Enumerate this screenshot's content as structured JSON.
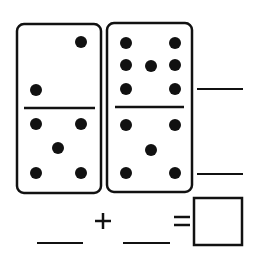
{
  "worksheet": {
    "colors": {
      "ink": "#111111",
      "paper": "#ffffff"
    },
    "dominoes": [
      {
        "top_pips": 2,
        "bottom_pips": 5,
        "top_dots": [
          [
            81,
            42
          ],
          [
            36,
            90
          ]
        ],
        "bottom_dots": [
          [
            36,
            124
          ],
          [
            81,
            124
          ],
          [
            58,
            148
          ],
          [
            36,
            173
          ],
          [
            81,
            173
          ]
        ]
      },
      {
        "top_pips": 7,
        "bottom_pips": 5,
        "top_dots": [
          [
            126,
            43
          ],
          [
            175,
            43
          ],
          [
            126,
            65
          ],
          [
            151,
            66
          ],
          [
            175,
            65
          ],
          [
            126,
            89
          ],
          [
            175,
            89
          ]
        ],
        "bottom_dots": [
          [
            126,
            125
          ],
          [
            175,
            125
          ],
          [
            151,
            150
          ],
          [
            126,
            173
          ],
          [
            175,
            173
          ]
        ]
      }
    ],
    "equation": {
      "plus_symbol": "+",
      "equals_symbol": "=",
      "answer_box": ""
    }
  }
}
